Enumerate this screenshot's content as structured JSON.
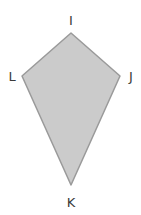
{
  "diagram": {
    "type": "kite",
    "fill_color": "#cbcbcb",
    "stroke_color": "#9a9a9a",
    "vertices": [
      {
        "name": "I",
        "x": 71,
        "y": 33
      },
      {
        "name": "J",
        "x": 120,
        "y": 76
      },
      {
        "name": "K",
        "x": 71,
        "y": 185
      },
      {
        "name": "L",
        "x": 22,
        "y": 76
      }
    ],
    "labels": {
      "I": {
        "text": "I",
        "x": 71,
        "y": 25
      },
      "J": {
        "text": "J",
        "x": 131,
        "y": 81
      },
      "K": {
        "text": "K",
        "x": 71,
        "y": 207
      },
      "L": {
        "text": "L",
        "x": 12,
        "y": 81
      }
    }
  }
}
